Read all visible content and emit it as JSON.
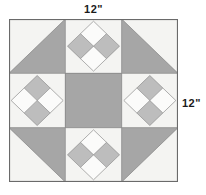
{
  "diagram": {
    "kind": "quilt-block-diagram",
    "background_color": "#ffffff",
    "labels": {
      "top": "12\"",
      "right": "12\""
    },
    "block": {
      "grid_rows": 3,
      "grid_cols": 3,
      "x": 9,
      "y": 19,
      "width": 169,
      "height": 163,
      "outline_color": "#666666",
      "seam_color": "#808080"
    },
    "colors": {
      "light": "#f4f4f2",
      "white": "#fbfbfa",
      "gray": "#a6a6a6",
      "gray_light": "#bdbdbd",
      "outline": "#6a6a6a",
      "seam": "#8c8c8c",
      "text": "#1a1a1a"
    },
    "cells": [
      {
        "position": "top-left",
        "row": 0,
        "col": 0,
        "type": "half-square-triangle",
        "light_corner": "top-left",
        "gray_corner": "bottom-right"
      },
      {
        "position": "top-center",
        "row": 0,
        "col": 1,
        "type": "four-patch-on-point",
        "quadrants": {
          "top": "white",
          "right": "gray",
          "bottom": "white",
          "left": "gray"
        }
      },
      {
        "position": "top-right",
        "row": 0,
        "col": 2,
        "type": "half-square-triangle",
        "light_corner": "top-right",
        "gray_corner": "bottom-left"
      },
      {
        "position": "middle-left",
        "row": 1,
        "col": 0,
        "type": "four-patch-on-point",
        "quadrants": {
          "top": "gray",
          "right": "white",
          "bottom": "gray",
          "left": "white"
        }
      },
      {
        "position": "center",
        "row": 1,
        "col": 1,
        "type": "solid-square",
        "fill": "gray"
      },
      {
        "position": "middle-right",
        "row": 1,
        "col": 2,
        "type": "four-patch-on-point",
        "quadrants": {
          "top": "gray",
          "right": "white",
          "bottom": "gray",
          "left": "white"
        }
      },
      {
        "position": "bottom-left",
        "row": 2,
        "col": 0,
        "type": "half-square-triangle",
        "light_corner": "bottom-left",
        "gray_corner": "top-right"
      },
      {
        "position": "bottom-center",
        "row": 2,
        "col": 1,
        "type": "four-patch-on-point",
        "quadrants": {
          "top": "white",
          "right": "gray",
          "bottom": "white",
          "left": "gray"
        }
      },
      {
        "position": "bottom-right",
        "row": 2,
        "col": 2,
        "type": "half-square-triangle",
        "light_corner": "bottom-right",
        "gray_corner": "top-left"
      }
    ]
  }
}
